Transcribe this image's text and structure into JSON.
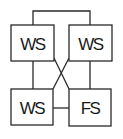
{
  "diagram": {
    "nodes": [
      {
        "id": "top-left",
        "label": "WS",
        "x": 11,
        "y": 25,
        "w": 43,
        "h": 36
      },
      {
        "id": "top-right",
        "label": "WS",
        "x": 69,
        "y": 25,
        "w": 43,
        "h": 36
      },
      {
        "id": "bottom-left",
        "label": "WS",
        "x": 11,
        "y": 89,
        "w": 42,
        "h": 36
      },
      {
        "id": "bottom-right",
        "label": "FS",
        "x": 69,
        "y": 89,
        "w": 42,
        "h": 37
      }
    ],
    "edges": [
      {
        "from": "top-left",
        "to": "top-right",
        "type": "top-bracket"
      },
      {
        "from": "top-left",
        "to": "bottom-left",
        "type": "vertical"
      },
      {
        "from": "top-right",
        "to": "bottom-right",
        "type": "vertical"
      },
      {
        "from": "top-left",
        "to": "bottom-right",
        "type": "diagonal"
      },
      {
        "from": "top-right",
        "to": "bottom-left",
        "type": "diagonal"
      },
      {
        "from": "bottom-left",
        "to": "bottom-right",
        "type": "horizontal"
      }
    ],
    "colors": {
      "stroke": "#2a2a2a",
      "background": "#ffffff",
      "text": "#1a1a1a"
    }
  }
}
